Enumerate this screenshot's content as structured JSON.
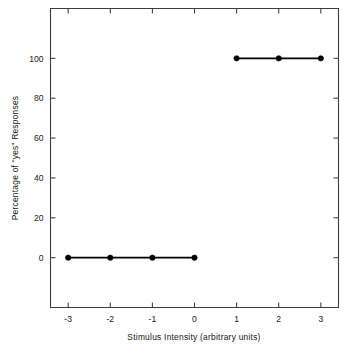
{
  "chart_data": {
    "type": "line",
    "title": "",
    "subtitle": "",
    "xlabel": "Stimulus Intensity (arbitrary units)",
    "ylabel": "Percentage of “yes” Responses",
    "xlim": [
      -3.42,
      3.42
    ],
    "ylim": [
      -25,
      125
    ],
    "grid": false,
    "legend": null,
    "x_ticks": [
      -3,
      -2,
      -1,
      0,
      1,
      2,
      3
    ],
    "x_tick_labels": [
      "-3",
      "-2",
      "-1",
      "0",
      "1",
      "2",
      "3"
    ],
    "y_ticks": [
      0,
      20,
      40,
      60,
      80,
      100
    ],
    "y_tick_labels": [
      "0",
      "20",
      "40",
      "60",
      "80",
      "100"
    ],
    "marker": "filled-circle",
    "series": [
      {
        "name": "lower-plateau",
        "x": [
          -3,
          -2,
          -1,
          0
        ],
        "values": [
          0,
          0,
          0,
          0
        ]
      },
      {
        "name": "upper-plateau",
        "x": [
          1,
          2,
          3
        ],
        "values": [
          100,
          100,
          100
        ]
      }
    ],
    "colors": {
      "line": "#000000",
      "marker": "#000000",
      "axis": "#3c3c3c",
      "text": "#1a1a1a",
      "background": "#ffffff"
    }
  }
}
